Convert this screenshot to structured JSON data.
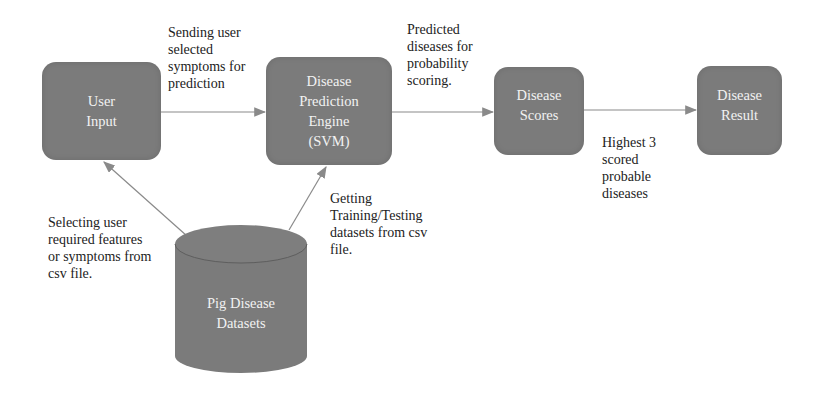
{
  "diagram": {
    "type": "flowchart",
    "nodes": [
      {
        "id": "user_input",
        "label": "User\nInput",
        "shape": "rounded-rect"
      },
      {
        "id": "engine",
        "label": "Disease\nPrediction\nEngine\n(SVM)",
        "shape": "rounded-rect"
      },
      {
        "id": "scores",
        "label": "Disease\nScores",
        "shape": "rounded-rect"
      },
      {
        "id": "result",
        "label": "Disease\nResult",
        "shape": "rounded-rect"
      },
      {
        "id": "datasets",
        "label": "Pig Disease\nDatasets",
        "shape": "cylinder"
      }
    ],
    "edges": [
      {
        "from": "user_input",
        "to": "engine",
        "label": "Sending user\nselected\nsymptoms for\nprediction"
      },
      {
        "from": "engine",
        "to": "scores",
        "label": "Predicted\ndiseases for\nprobability\nscoring."
      },
      {
        "from": "scores",
        "to": "result",
        "label": "Highest 3\nscored\nprobable\ndiseases"
      },
      {
        "from": "datasets",
        "to": "user_input",
        "label": " Selecting user\nrequired features\nor symptoms from\ncsv file."
      },
      {
        "from": "datasets",
        "to": "engine",
        "label": "Getting\nTraining/Testing\ndatasets from csv\nfile."
      }
    ],
    "colors": {
      "node_fill": "#7b7b7b",
      "node_text": "#f2f2f2",
      "edge": "#8a8a8a",
      "label_text": "#222222"
    }
  }
}
